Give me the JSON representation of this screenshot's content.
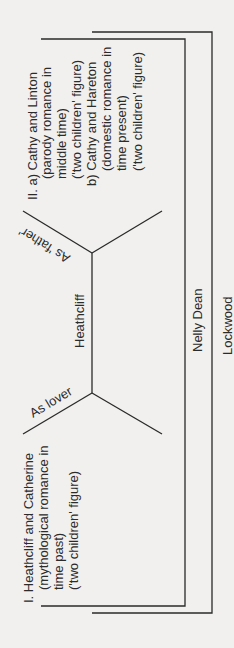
{
  "diagram": {
    "orientation": "rotated 90 degrees counter-clockwise",
    "group_one": {
      "lines": [
        "I. Heathcliff and Catherine",
        "(mythological romance in",
        "time past)",
        "('two children' figure)"
      ]
    },
    "group_two": {
      "lines": [
        "II. a) Cathy and Linton",
        "(parody romance in",
        "middle time)",
        "('two children' figure)",
        "b) Cathy and Hareton",
        "(domestic romance in",
        "time present)",
        "('two children' figure)"
      ]
    },
    "central_node": "Heathcliff",
    "branch_lover": "As lover",
    "branch_father": "As 'father'",
    "narrator_inner": "Nelly Dean",
    "narrator_outer": "Lockwood"
  }
}
